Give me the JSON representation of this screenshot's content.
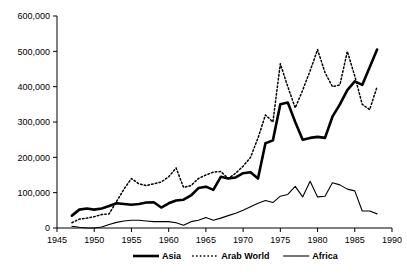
{
  "chart_data": {
    "type": "line",
    "title": "",
    "subtitle": "",
    "xlabel": "",
    "ylabel": "",
    "xlim": [
      1945,
      1990
    ],
    "ylim": [
      0,
      600000
    ],
    "grid": false,
    "legend_position": "bottom",
    "x_ticks": [
      "1945",
      "1950",
      "1955",
      "1960",
      "1965",
      "1970",
      "1975",
      "1980",
      "1985",
      "1990"
    ],
    "x_tick_values": [
      1945,
      1950,
      1955,
      1960,
      1965,
      1970,
      1975,
      1980,
      1985,
      1990
    ],
    "y_ticks": [
      "0",
      "100,000",
      "200,000",
      "300,000",
      "400,000",
      "500,000",
      "600,000"
    ],
    "y_tick_values": [
      0,
      100000,
      200000,
      300000,
      400000,
      500000,
      600000
    ],
    "x": [
      1947,
      1948,
      1949,
      1950,
      1951,
      1952,
      1953,
      1954,
      1955,
      1956,
      1957,
      1958,
      1959,
      1960,
      1961,
      1962,
      1963,
      1964,
      1965,
      1966,
      1967,
      1968,
      1969,
      1970,
      1971,
      1972,
      1973,
      1974,
      1975,
      1976,
      1977,
      1978,
      1979,
      1980,
      1981,
      1982,
      1983,
      1984,
      1985,
      1986,
      1987,
      1988
    ],
    "series": [
      {
        "name": "Asia",
        "style": "thick-solid",
        "color": "#000000",
        "values": [
          35000,
          52000,
          55000,
          52000,
          55000,
          62000,
          70000,
          68000,
          66000,
          68000,
          72000,
          73000,
          58000,
          70000,
          78000,
          80000,
          92000,
          113000,
          117000,
          108000,
          145000,
          140000,
          143000,
          155000,
          158000,
          140000,
          240000,
          248000,
          350000,
          355000,
          300000,
          250000,
          255000,
          258000,
          255000,
          315000,
          350000,
          390000,
          415000,
          405000,
          455000,
          505000
        ]
      },
      {
        "name": "Arab World",
        "style": "dotted",
        "color": "#000000",
        "values": [
          15000,
          25000,
          28000,
          32000,
          38000,
          40000,
          75000,
          110000,
          140000,
          125000,
          120000,
          125000,
          130000,
          145000,
          170000,
          115000,
          120000,
          140000,
          150000,
          158000,
          160000,
          140000,
          155000,
          175000,
          200000,
          255000,
          320000,
          300000,
          465000,
          400000,
          340000,
          390000,
          445000,
          505000,
          440000,
          400000,
          405000,
          500000,
          430000,
          350000,
          335000,
          400000
        ]
      },
      {
        "name": "Africa",
        "style": "thin-solid",
        "color": "#000000",
        "values": [
          5000,
          2000,
          0,
          0,
          3000,
          10000,
          16000,
          20000,
          22000,
          22000,
          20000,
          18000,
          18000,
          18000,
          15000,
          8000,
          18000,
          22000,
          30000,
          22000,
          28000,
          35000,
          42000,
          50000,
          60000,
          70000,
          78000,
          72000,
          90000,
          95000,
          118000,
          88000,
          132000,
          88000,
          90000,
          128000,
          122000,
          110000,
          105000,
          48000,
          48000,
          40000
        ]
      }
    ],
    "legend": [
      {
        "label": "Asia",
        "style": "thick-solid"
      },
      {
        "label": "Arab World",
        "style": "dotted"
      },
      {
        "label": "Africa",
        "style": "thin-solid"
      }
    ]
  }
}
